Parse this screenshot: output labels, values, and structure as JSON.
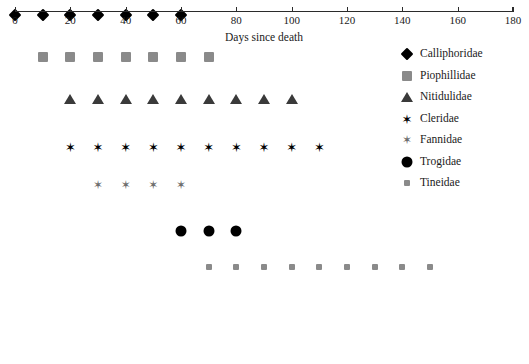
{
  "chart_data": {
    "type": "scatter",
    "title": "",
    "subtitle": "",
    "xlabel": "Days since death",
    "ylabel": "",
    "xlim": [
      0,
      180
    ],
    "xticks": [
      0,
      20,
      40,
      60,
      80,
      100,
      120,
      140,
      160,
      180
    ],
    "xticklabels": [
      "0",
      "20",
      "40",
      "60",
      "80",
      "100",
      "120",
      "140",
      "160",
      "180"
    ],
    "grid": false,
    "legend_position": "right",
    "series": [
      {
        "name": "Calliphoridae",
        "marker": "diamond",
        "color": "#000000",
        "row": 1,
        "x": [
          0,
          10,
          20,
          30,
          40,
          50,
          60
        ],
        "values": [
          1,
          1,
          1,
          1,
          1,
          1,
          1
        ]
      },
      {
        "name": "Piophillidae",
        "marker": "square",
        "color": "#8a8a8a",
        "row": 2,
        "x": [
          10,
          20,
          30,
          40,
          50,
          60,
          70
        ],
        "values": [
          1,
          1,
          1,
          1,
          1,
          1,
          1
        ]
      },
      {
        "name": "Nitidulidae",
        "marker": "triangle",
        "color": "#3a3a3a",
        "row": 3,
        "x": [
          20,
          30,
          40,
          50,
          60,
          70,
          80,
          90,
          100
        ],
        "values": [
          1,
          1,
          1,
          1,
          1,
          1,
          1,
          1,
          1
        ]
      },
      {
        "name": "Cleridae",
        "marker": "star",
        "color": "#000000",
        "row": 4,
        "x": [
          20,
          30,
          40,
          50,
          60,
          70,
          80,
          90,
          100,
          110
        ],
        "values": [
          1,
          1,
          1,
          1,
          1,
          1,
          1,
          1,
          1,
          1
        ]
      },
      {
        "name": "Fannidae",
        "marker": "star-gray",
        "color": "#6f6f6f",
        "row": 5,
        "x": [
          30,
          40,
          50,
          60
        ],
        "values": [
          1,
          1,
          1,
          1
        ]
      },
      {
        "name": "Trogidae",
        "marker": "circle",
        "color": "#000000",
        "row": 6,
        "x": [
          60,
          70,
          80
        ],
        "values": [
          1,
          1,
          1
        ]
      },
      {
        "name": "Tineidae",
        "marker": "square-small",
        "color": "#8a8a8a",
        "row": 7,
        "x": [
          70,
          80,
          90,
          100,
          110,
          120,
          130,
          140,
          150
        ],
        "values": [
          1,
          1,
          1,
          1,
          1,
          1,
          1,
          1,
          1
        ]
      }
    ]
  },
  "axis": {
    "title": "Days since death",
    "ticks": [
      "0",
      "20",
      "40",
      "60",
      "80",
      "100",
      "120",
      "140",
      "160",
      "180"
    ]
  },
  "legend": {
    "items": [
      {
        "label": "Calliphoridae",
        "marker": "diamond"
      },
      {
        "label": "Piophillidae",
        "marker": "square"
      },
      {
        "label": "Nitidulidae",
        "marker": "triangle"
      },
      {
        "label": "Cleridae",
        "marker": "star"
      },
      {
        "label": "Fannidae",
        "marker": "star-gray"
      },
      {
        "label": "Trogidae",
        "marker": "circle"
      },
      {
        "label": "Tineidae",
        "marker": "square-small"
      }
    ]
  },
  "colors": {
    "black": "#000000",
    "dark_gray": "#3a3a3a",
    "mid_gray": "#6f6f6f",
    "light_gray": "#8a8a8a",
    "axis": "#2b2b2b",
    "background": "#ffffff"
  },
  "star_glyph": "✶"
}
